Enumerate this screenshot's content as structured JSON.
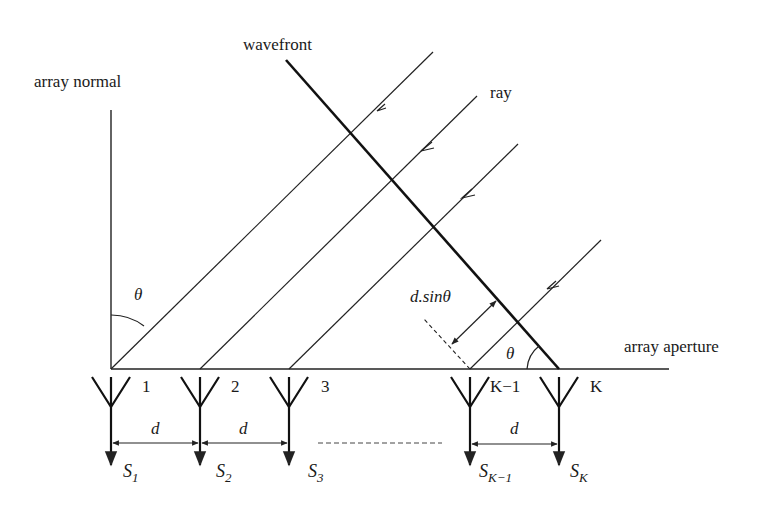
{
  "diagram": {
    "labels": {
      "array_normal": "array normal",
      "wavefront": "wavefront",
      "ray": "ray",
      "array_aperture": "array aperture",
      "theta_top": "θ",
      "theta_bottom": "θ",
      "path_diff": "d.sinθ"
    },
    "elements": [
      {
        "index": "1",
        "signal": "S",
        "sub": "1",
        "x": 111
      },
      {
        "index": "2",
        "signal": "S",
        "sub": "2",
        "x": 200
      },
      {
        "index": "3",
        "signal": "S",
        "sub": "3",
        "x": 289
      },
      {
        "index": "K−1",
        "signal": "S",
        "sub": "K−1",
        "x": 470
      },
      {
        "index": "K",
        "signal": "S",
        "sub": "K",
        "x": 559
      }
    ],
    "spacings": [
      {
        "label": "d",
        "from": "1",
        "to": "2"
      },
      {
        "label": "d",
        "from": "2",
        "to": "3"
      },
      {
        "label": "d",
        "from": "K−1",
        "to": "K"
      }
    ],
    "colors": {
      "line": "#222222",
      "text": "#1a1a1a",
      "background": "#ffffff"
    }
  }
}
